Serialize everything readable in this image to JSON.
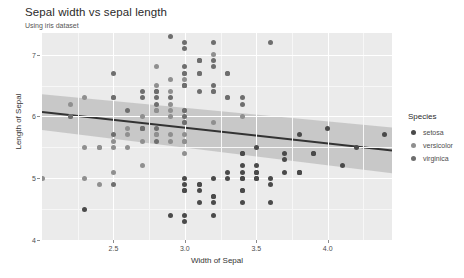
{
  "header": {
    "title": "Sepal width vs sepal length",
    "subtitle": "Using iris dataset"
  },
  "legend": {
    "title": "Species",
    "items": [
      {
        "label": "setosa",
        "color": "#4a4a4a"
      },
      {
        "label": "versicolor",
        "color": "#8f8f8f"
      },
      {
        "label": "virginica",
        "color": "#6e6e6e"
      }
    ]
  },
  "chart_data": {
    "type": "scatter",
    "title": "Sepal width vs sepal length",
    "subtitle": "Using iris dataset",
    "xlabel": "Width of Sepal",
    "ylabel": "Length of Sepal",
    "xlim": [
      2.0,
      4.45
    ],
    "ylim": [
      4.0,
      7.35
    ],
    "xticks": [
      2.5,
      3.0,
      3.5,
      4.0
    ],
    "xtick_labels": [
      "2.5",
      "3.0",
      "3.5",
      "4.0"
    ],
    "yticks": [
      4,
      5,
      6,
      7
    ],
    "ytick_labels": [
      "4",
      "5",
      "6",
      "7"
    ],
    "grid": true,
    "legend_position": "right",
    "legend_title": "Species",
    "panel_background": "#ebebeb",
    "gridline_color": "#ffffff",
    "point_size": 5,
    "fit": {
      "type": "linear",
      "line_color": "#333333",
      "band_color": "#b3b3b3",
      "x": [
        2.0,
        4.45
      ],
      "y": [
        6.07,
        5.45
      ],
      "band_lower": [
        5.78,
        5.08
      ],
      "band_upper": [
        6.36,
        5.82
      ]
    },
    "series": [
      {
        "name": "setosa",
        "color": "#4a4a4a",
        "x": [
          3.5,
          3.0,
          3.2,
          3.1,
          3.6,
          3.9,
          3.4,
          3.4,
          2.9,
          3.1,
          3.7,
          3.4,
          3.0,
          3.0,
          4.0,
          4.4,
          3.9,
          3.5,
          3.8,
          3.8,
          3.4,
          3.7,
          3.6,
          3.3,
          3.4,
          3.0,
          3.4,
          3.5,
          3.4,
          3.2,
          3.1,
          3.4,
          4.1,
          4.2,
          3.1,
          3.2,
          3.5,
          3.6,
          3.0,
          3.4,
          3.5,
          2.3,
          3.2,
          3.5,
          3.8,
          3.0,
          3.8,
          3.2,
          3.7,
          3.3
        ],
        "y": [
          5.1,
          4.9,
          4.7,
          4.6,
          5.0,
          5.4,
          4.6,
          5.0,
          4.4,
          4.9,
          5.4,
          4.8,
          4.8,
          4.3,
          5.8,
          5.7,
          5.4,
          5.1,
          5.7,
          5.1,
          5.4,
          5.1,
          4.6,
          5.1,
          4.8,
          5.0,
          5.0,
          5.2,
          5.2,
          4.7,
          4.8,
          5.4,
          5.2,
          5.5,
          4.9,
          5.0,
          5.5,
          4.9,
          4.4,
          5.1,
          5.0,
          4.5,
          4.4,
          5.0,
          5.1,
          4.8,
          5.1,
          4.6,
          5.3,
          5.0
        ]
      },
      {
        "name": "versicolor",
        "color": "#8f8f8f",
        "x": [
          3.2,
          3.2,
          3.1,
          2.3,
          2.8,
          2.8,
          3.3,
          2.4,
          2.9,
          2.7,
          2.0,
          3.0,
          2.2,
          2.9,
          2.9,
          3.1,
          3.0,
          2.7,
          2.2,
          2.5,
          3.2,
          2.8,
          2.5,
          2.8,
          2.9,
          3.0,
          2.8,
          3.0,
          2.9,
          2.6,
          2.4,
          2.4,
          2.7,
          2.7,
          3.0,
          3.4,
          3.1,
          2.3,
          3.0,
          2.5,
          2.6,
          3.0,
          2.6,
          2.3,
          2.7,
          3.0,
          2.9,
          2.9,
          2.5,
          2.8
        ],
        "y": [
          7.0,
          6.4,
          6.9,
          5.5,
          6.5,
          5.7,
          6.3,
          4.9,
          6.6,
          5.2,
          5.0,
          5.9,
          6.0,
          6.1,
          5.6,
          6.7,
          5.6,
          5.8,
          6.2,
          5.6,
          5.9,
          6.1,
          6.3,
          6.1,
          6.4,
          6.6,
          6.8,
          6.7,
          6.0,
          5.7,
          5.5,
          5.5,
          5.8,
          6.0,
          5.4,
          6.0,
          6.7,
          6.3,
          5.6,
          5.5,
          5.5,
          6.1,
          5.8,
          5.0,
          5.6,
          5.7,
          5.7,
          6.2,
          5.1,
          5.7
        ]
      },
      {
        "name": "virginica",
        "color": "#6e6e6e",
        "x": [
          3.3,
          2.7,
          3.0,
          2.9,
          3.0,
          3.0,
          2.5,
          2.9,
          2.5,
          3.6,
          3.2,
          2.7,
          3.0,
          2.5,
          2.8,
          3.2,
          3.0,
          3.8,
          2.6,
          2.2,
          3.2,
          2.8,
          2.8,
          2.7,
          3.3,
          3.2,
          2.8,
          3.0,
          2.8,
          3.0,
          2.8,
          3.8,
          2.8,
          2.8,
          2.6,
          3.0,
          3.4,
          3.1,
          3.0,
          3.1,
          3.1,
          3.1,
          2.7,
          3.2,
          3.3,
          3.0,
          2.5,
          3.0,
          3.4,
          3.0
        ],
        "y": [
          6.3,
          5.8,
          7.1,
          6.3,
          6.5,
          7.6,
          4.9,
          7.3,
          6.7,
          7.2,
          6.5,
          6.4,
          6.8,
          5.7,
          5.8,
          6.4,
          6.5,
          7.7,
          7.7,
          6.0,
          6.9,
          5.6,
          7.7,
          6.3,
          6.7,
          7.2,
          6.2,
          6.1,
          6.4,
          7.2,
          7.4,
          7.9,
          6.4,
          6.3,
          6.1,
          7.7,
          6.3,
          6.4,
          6.0,
          6.9,
          6.7,
          6.9,
          5.8,
          6.8,
          6.7,
          6.7,
          6.3,
          6.5,
          6.2,
          5.9
        ]
      }
    ]
  }
}
